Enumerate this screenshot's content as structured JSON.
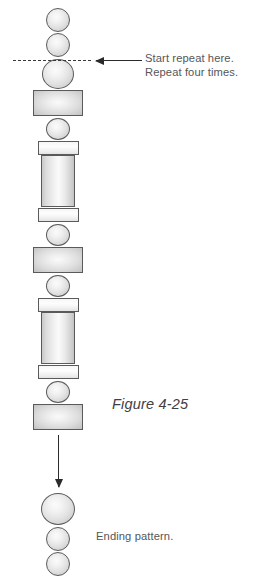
{
  "figure": {
    "caption": "Figure 4-25",
    "caption_x": 112,
    "caption_y": 396
  },
  "annotations": {
    "repeat_line_1": "Start repeat here.",
    "repeat_line_2": "Repeat four times.",
    "ending_label": "Ending pattern."
  },
  "colors": {
    "bead_outline": "#5a5a5a",
    "bead_fill_light": "#fafafa",
    "bead_fill_shade": "#c3c3c3",
    "arrow": "#2b2b2b",
    "dash_line": "#3a3a3a",
    "text": "#555658",
    "caption_text": "#3f4042",
    "background": "#ffffff"
  },
  "column": {
    "center_x": 58,
    "repeat_count": 4,
    "beads": [
      {
        "name": "bead-round-small-1",
        "shape": "round",
        "x": 46,
        "y": 8,
        "w": 24,
        "h": 24
      },
      {
        "name": "bead-round-small-2",
        "shape": "round",
        "x": 46,
        "y": 33,
        "w": 24,
        "h": 24
      },
      {
        "name": "bead-round-large-1",
        "shape": "round",
        "x": 42,
        "y": 59,
        "w": 32,
        "h": 30
      },
      {
        "name": "bead-rect-wide-1",
        "shape": "rect",
        "x": 33,
        "y": 90,
        "w": 50,
        "h": 26
      },
      {
        "name": "bead-round-small-3",
        "shape": "round",
        "x": 46,
        "y": 118,
        "w": 24,
        "h": 22
      },
      {
        "name": "bead-disc-1",
        "shape": "disc",
        "x": 37.5,
        "y": 141,
        "w": 41,
        "h": 14
      },
      {
        "name": "bead-tube-1",
        "shape": "tube",
        "x": 41,
        "y": 155,
        "w": 34,
        "h": 52
      },
      {
        "name": "bead-disc-2",
        "shape": "disc",
        "x": 37.5,
        "y": 208,
        "w": 41,
        "h": 14
      },
      {
        "name": "bead-round-small-4",
        "shape": "round",
        "x": 46,
        "y": 224,
        "w": 24,
        "h": 22
      },
      {
        "name": "bead-rect-wide-2",
        "shape": "rect",
        "x": 33,
        "y": 247,
        "w": 50,
        "h": 26
      },
      {
        "name": "bead-round-small-5",
        "shape": "round",
        "x": 46,
        "y": 275,
        "w": 24,
        "h": 22
      },
      {
        "name": "bead-disc-3",
        "shape": "disc",
        "x": 37.5,
        "y": 298,
        "w": 41,
        "h": 14
      },
      {
        "name": "bead-tube-2",
        "shape": "tube",
        "x": 41,
        "y": 312,
        "w": 34,
        "h": 52
      },
      {
        "name": "bead-disc-4",
        "shape": "disc",
        "x": 37.5,
        "y": 365,
        "w": 41,
        "h": 14
      },
      {
        "name": "bead-round-small-6",
        "shape": "round",
        "x": 46,
        "y": 381,
        "w": 24,
        "h": 22
      },
      {
        "name": "bead-rect-wide-3",
        "shape": "rect",
        "x": 33,
        "y": 404,
        "w": 50,
        "h": 26
      },
      {
        "name": "bead-round-end-1",
        "shape": "round",
        "x": 41,
        "y": 493,
        "w": 34,
        "h": 32
      },
      {
        "name": "bead-round-end-2",
        "shape": "round",
        "x": 46,
        "y": 527,
        "w": 24,
        "h": 24
      },
      {
        "name": "bead-round-end-3",
        "shape": "round",
        "x": 46,
        "y": 552,
        "w": 24,
        "h": 24
      }
    ]
  },
  "markers": {
    "dash_line": {
      "x": 13,
      "y": 60,
      "w": 78
    },
    "repeat_arrow": {
      "x": 96,
      "y": 60,
      "w": 46
    },
    "down_arrow": {
      "x": 58,
      "y": 435,
      "h": 52
    }
  },
  "labels": {
    "repeat_note_x": 145,
    "repeat_note_y": 52,
    "ending_label_x": 96,
    "ending_label_y": 530
  }
}
